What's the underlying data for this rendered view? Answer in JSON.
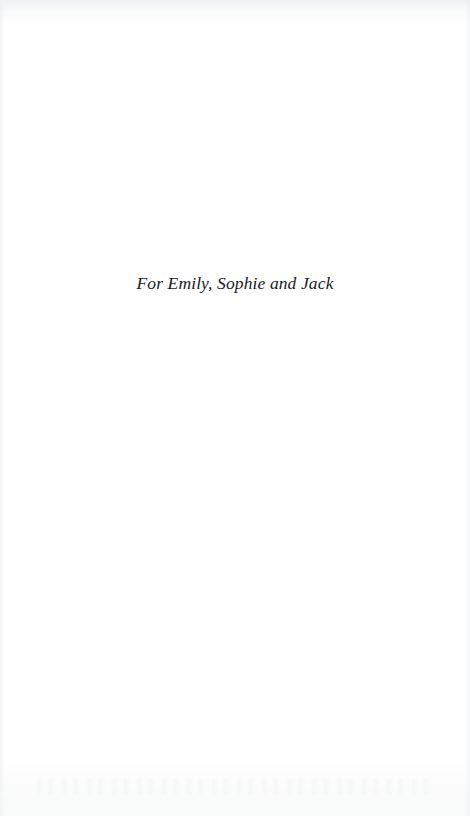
{
  "page": {
    "kind": "book-dedication-page",
    "background_color": "#ffffff",
    "text_color": "#1a1a1c"
  },
  "dedication": {
    "text": "For Emily, Sophie and Jack"
  }
}
